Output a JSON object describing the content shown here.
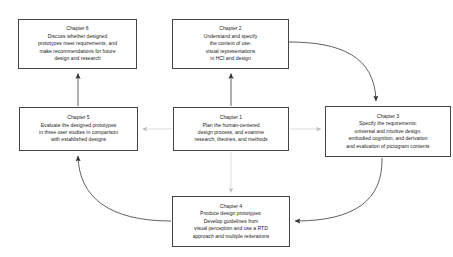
{
  "diagram": {
    "stroke_color": "#444444",
    "faint_stroke_color": "#c9c9c9",
    "background_color": "#ffffff"
  },
  "nodes": {
    "ch1": {
      "id": "chapter-1",
      "title": "Chapter 1",
      "lines": [
        "Plan the human-centered",
        "design process, and examine",
        "research, theories, and methods"
      ]
    },
    "ch2": {
      "id": "chapter-2",
      "title": "Chapter 2",
      "lines": [
        "Understand and specify",
        "the context of use:",
        "visual representations",
        "in HCI and design"
      ]
    },
    "ch3": {
      "id": "chapter-3",
      "title": "Chapter 3",
      "lines": [
        "Specify the requirements:",
        "universal and intuitive design,",
        "embodied cognition, and derivation",
        "and evaluation of pictogram contents"
      ]
    },
    "ch4": {
      "id": "chapter-4",
      "title": "Chapter 4",
      "lines": [
        "Produce design prototypes:",
        "Develop guidelines from",
        "visual perception and use a RTD",
        "approach and multiple reiterations"
      ]
    },
    "ch5": {
      "id": "chapter-5",
      "title": "Chapter 5",
      "lines": [
        "Evaluate the designed prototypes",
        "in three user studies in comparison",
        "with established designs"
      ]
    },
    "ch6": {
      "id": "chapter-6",
      "title": "Chapter 6",
      "lines": [
        "Discuss whether designed",
        "prototypes meet requirements, and",
        "make recommendations for future",
        "design and research"
      ]
    }
  },
  "edges": [
    {
      "name": "edge-ch1-to-ch2",
      "from": "ch1",
      "to": "ch2",
      "style": "straight-vertical",
      "weight": "solid"
    },
    {
      "name": "edge-ch1-to-ch5",
      "from": "ch1",
      "to": "ch5",
      "style": "straight-horizontal",
      "weight": "faint"
    },
    {
      "name": "edge-ch1-to-ch3",
      "from": "ch1",
      "to": "ch3",
      "style": "straight-horizontal",
      "weight": "faint"
    },
    {
      "name": "edge-ch1-to-ch4",
      "from": "ch1",
      "to": "ch4",
      "style": "straight-vertical",
      "weight": "faint"
    },
    {
      "name": "edge-ch2-to-ch3",
      "from": "ch2",
      "to": "ch3",
      "style": "curved",
      "weight": "solid"
    },
    {
      "name": "edge-ch3-to-ch4",
      "from": "ch3",
      "to": "ch4",
      "style": "curved",
      "weight": "solid"
    },
    {
      "name": "edge-ch4-to-ch5",
      "from": "ch4",
      "to": "ch5",
      "style": "curved",
      "weight": "solid"
    },
    {
      "name": "edge-ch5-to-ch6",
      "from": "ch5",
      "to": "ch6",
      "style": "straight-vertical",
      "weight": "solid"
    }
  ]
}
